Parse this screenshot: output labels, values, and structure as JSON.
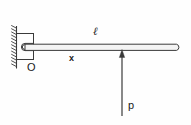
{
  "figure": {
    "kind": "engineering-mechanics-diagram",
    "background_color": "#fefefe",
    "stroke_color": "#3a3a3a",
    "text_color": "#1a1a1a",
    "width": 191,
    "height": 125
  },
  "labels": {
    "length": "ℓ",
    "distance": "x",
    "origin": "O",
    "load": "p"
  },
  "elements": {
    "wall": {
      "name": "hatched-fixed-wall",
      "x": 14,
      "y_top": 26,
      "y_bottom": 68,
      "hatch_count": 13
    },
    "bracket": {
      "name": "support-bracket",
      "left": 16,
      "top": 33,
      "right": 34,
      "bottom": 60
    },
    "pin": {
      "name": "pin-joint",
      "cx": 24,
      "cy": 47,
      "r": 2.6
    },
    "beam": {
      "name": "horizontal-beam",
      "x_start": 24,
      "x_end": 180,
      "y_top": 44,
      "y_bottom": 50,
      "rounded_tip": true
    },
    "load_arrow": {
      "name": "upward-force-arrow",
      "x": 122,
      "y_tail": 116,
      "y_head": 49,
      "direction": "up"
    }
  }
}
